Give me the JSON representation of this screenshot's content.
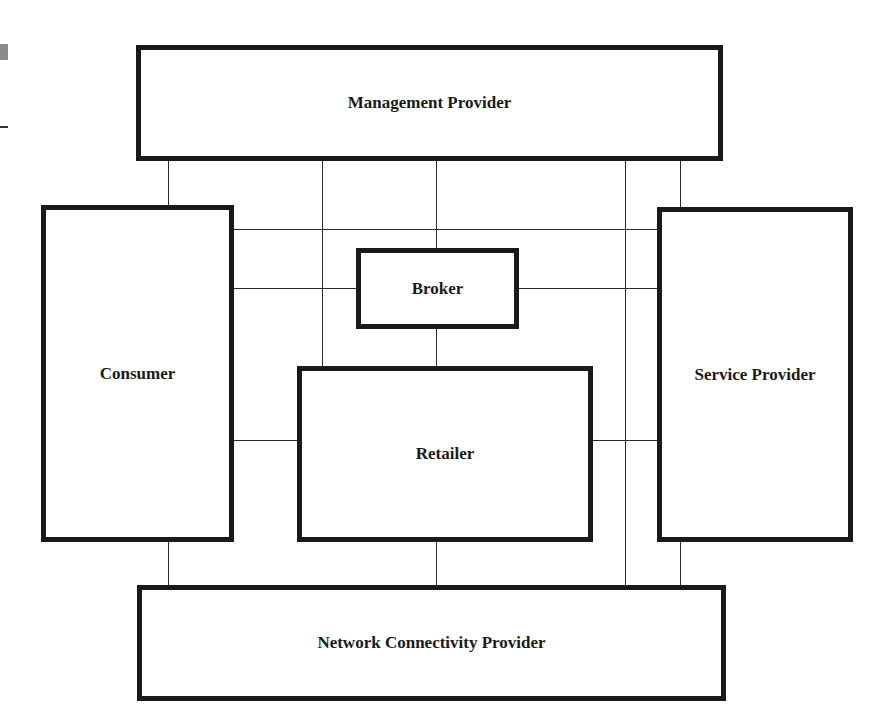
{
  "diagram": {
    "title": "",
    "boxes": [
      {
        "id": "management_provider",
        "label": "Management Provider"
      },
      {
        "id": "consumer",
        "label": "Consumer"
      },
      {
        "id": "broker",
        "label": "Broker"
      },
      {
        "id": "retailer",
        "label": "Retailer"
      },
      {
        "id": "service_provider",
        "label": "Service Provider"
      },
      {
        "id": "network_connectivity_provider",
        "label": "Network Connectivity Provider"
      }
    ],
    "connections": [
      {
        "from": "Management Provider",
        "to": "Consumer"
      },
      {
        "from": "Management Provider",
        "to": "Broker"
      },
      {
        "from": "Management Provider",
        "to": "Retailer"
      },
      {
        "from": "Management Provider",
        "to": "Service Provider"
      },
      {
        "from": "Management Provider",
        "to": "Network Connectivity Provider"
      },
      {
        "from": "Consumer",
        "to": "Service Provider"
      },
      {
        "from": "Consumer",
        "to": "Broker"
      },
      {
        "from": "Broker",
        "to": "Service Provider"
      },
      {
        "from": "Broker",
        "to": "Retailer"
      },
      {
        "from": "Consumer",
        "to": "Retailer"
      },
      {
        "from": "Retailer",
        "to": "Service Provider"
      },
      {
        "from": "Consumer",
        "to": "Network Connectivity Provider"
      },
      {
        "from": "Retailer",
        "to": "Network Connectivity Provider"
      },
      {
        "from": "Service Provider",
        "to": "Network Connectivity Provider"
      }
    ],
    "colors": {
      "box_border": "#1a1a1a",
      "line": "#2a2a2a",
      "background": "#ffffff"
    }
  }
}
